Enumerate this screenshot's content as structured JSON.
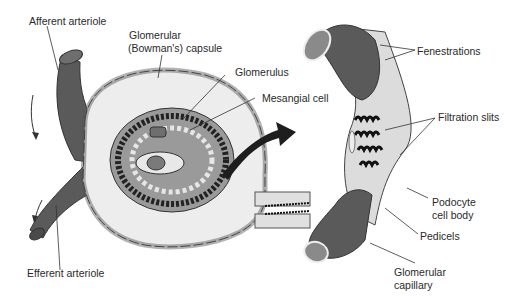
{
  "diagram": {
    "left_panel": {
      "title": "Renal corpuscle",
      "labels": {
        "afferent_arteriole": "Afferent arteriole",
        "capsule_line1": "Glomerular",
        "capsule_line2": "(Bowman's) capsule",
        "glomerulus": "Glomerulus",
        "mesangial_cell": "Mesangial cell",
        "efferent_arteriole": "Efferent arteriole"
      }
    },
    "right_panel": {
      "title": "Glomerular capillary detail",
      "labels": {
        "fenestrations": "Fenestrations",
        "filtration_slits": "Filtration slits",
        "podocyte_line1": "Podocyte",
        "podocyte_line2": "cell body",
        "pedicels": "Pedicels",
        "capillary_line1": "Glomerular",
        "capillary_line2": "capillary"
      }
    },
    "colors": {
      "vessel": "#5a5a5a",
      "vessel_light": "#8a8a8a",
      "capsule_fill": "#ececec",
      "capsule_cells": "#c8c8c8",
      "podocyte": "#d9d9d9",
      "outline": "#3a3a3a",
      "arrow": "#1e1e1e"
    }
  }
}
